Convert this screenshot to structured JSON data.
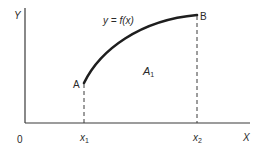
{
  "diagram": {
    "axes": {
      "y_label": "Y",
      "x_label": "X",
      "origin_label": "0"
    },
    "curve": {
      "label": "y = f(x)",
      "start_point": "A",
      "end_point": "B"
    },
    "area_label": {
      "main": "A",
      "sub": "1"
    },
    "x_ticks": [
      {
        "main": "x",
        "sub": "1"
      },
      {
        "main": "x",
        "sub": "2"
      }
    ],
    "colors": {
      "line": "#2a2a2a",
      "background": "#ffffff"
    }
  }
}
